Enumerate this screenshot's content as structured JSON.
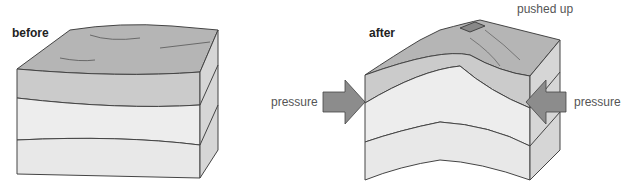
{
  "diagram": {
    "panels": [
      {
        "id": "before",
        "label": "before"
      },
      {
        "id": "after",
        "label": "after"
      }
    ],
    "annotations": {
      "pushed_up": "pushed up",
      "pressure_left": "pressure",
      "pressure_right": "pressure"
    },
    "colors": {
      "top_surface": "#b4b4b4",
      "layer_top": "#c8c8c8",
      "layer_mid": "#ececec",
      "layer_bottom": "#e6e6e6",
      "side_face": "#d8d8d8",
      "arrow": "#8c8c8c",
      "outline": "#444444"
    }
  }
}
